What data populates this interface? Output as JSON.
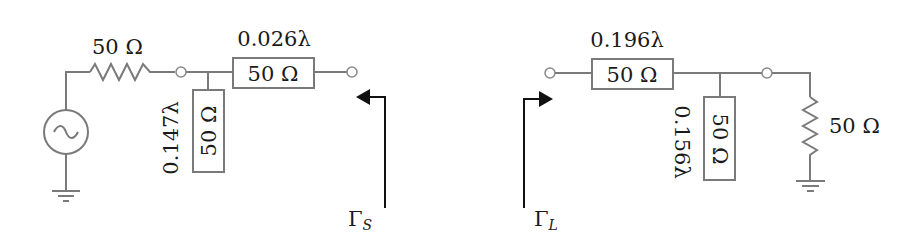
{
  "diagram": {
    "type": "circuit",
    "colors": {
      "wire": "#7a7a7a",
      "text": "#1a1a1a",
      "arrow": "#111111"
    },
    "source_network": {
      "source": {
        "type": "ac-voltage-source",
        "icon": "tilde"
      },
      "source_resistor": {
        "label": "50 Ω"
      },
      "series_line": {
        "length": "0.026λ",
        "impedance": "50 Ω"
      },
      "stub": {
        "length": "0.147λ",
        "impedance": "50 Ω"
      },
      "reflection": {
        "symbol": "Γ",
        "subscript": "S"
      }
    },
    "load_network": {
      "series_line": {
        "length": "0.196λ",
        "impedance": "50 Ω"
      },
      "stub": {
        "length": "0.156λ",
        "impedance": "50 Ω"
      },
      "load_resistor": {
        "label": "50 Ω"
      },
      "reflection": {
        "symbol": "Γ",
        "subscript": "L"
      }
    }
  }
}
